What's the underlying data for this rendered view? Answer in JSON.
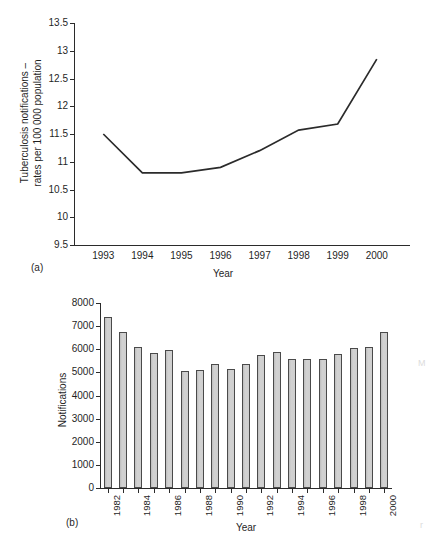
{
  "figure_a": {
    "panel_label": "(a)",
    "ylabel_line1": "Tuberculosis notifications –",
    "ylabel_line2": "rates per 100 000 population",
    "xlabel": "Year"
  },
  "figure_b": {
    "panel_label": "(b)",
    "ylabel": "Notifications",
    "xlabel": "Year"
  },
  "chart_data": [
    {
      "type": "line",
      "panel": "(a)",
      "title": "",
      "xlabel": "Year",
      "ylabel": "Tuberculosis notifications – rates per 100 000 population",
      "categories": [
        "1993",
        "1994",
        "1995",
        "1996",
        "1997",
        "1998",
        "1999",
        "2000"
      ],
      "x": [
        1993,
        1994,
        1995,
        1996,
        1997,
        1998,
        1999,
        2000
      ],
      "values": [
        11.5,
        10.8,
        10.8,
        10.9,
        11.2,
        11.57,
        11.68,
        12.85
      ],
      "ylim": [
        9.5,
        13.5
      ],
      "ytick_labels": [
        "9.5",
        "10",
        "10.5",
        "11",
        "11.5",
        "12",
        "12.5",
        "13",
        "13.5"
      ],
      "yticks": [
        9.5,
        10,
        10.5,
        11,
        11.5,
        12,
        12.5,
        13,
        13.5
      ],
      "xtick_labels": [
        "1993",
        "1994",
        "1995",
        "1996",
        "1997",
        "1998",
        "1999",
        "2000"
      ],
      "grid": false,
      "legend": "none",
      "line_color": "#2b2b2b"
    },
    {
      "type": "bar",
      "panel": "(b)",
      "title": "",
      "xlabel": "Year",
      "ylabel": "Notifications",
      "categories": [
        "1982",
        "1983",
        "1984",
        "1985",
        "1986",
        "1987",
        "1988",
        "1989",
        "1990",
        "1991",
        "1992",
        "1993",
        "1994",
        "1995",
        "1996",
        "1997",
        "1998",
        "1999",
        "2000"
      ],
      "values": [
        7400,
        6750,
        6100,
        5820,
        5960,
        5060,
        5120,
        5370,
        5140,
        5360,
        5740,
        5890,
        5580,
        5570,
        5600,
        5800,
        6040,
        6100,
        6760
      ],
      "ylim": [
        0,
        8000
      ],
      "yticks": [
        0,
        1000,
        2000,
        3000,
        4000,
        5000,
        6000,
        7000,
        8000
      ],
      "ytick_labels": [
        "0",
        "1000",
        "2000",
        "3000",
        "4000",
        "5000",
        "6000",
        "7000",
        "8000"
      ],
      "xtick_labels_shown": [
        "1982",
        "1984",
        "1986",
        "1988",
        "1990",
        "1992",
        "1994",
        "1996",
        "1998",
        "2000"
      ],
      "grid": false,
      "legend": "none",
      "bar_fill": "#c9c9c9",
      "bar_edge": "#4a4a4a"
    }
  ]
}
